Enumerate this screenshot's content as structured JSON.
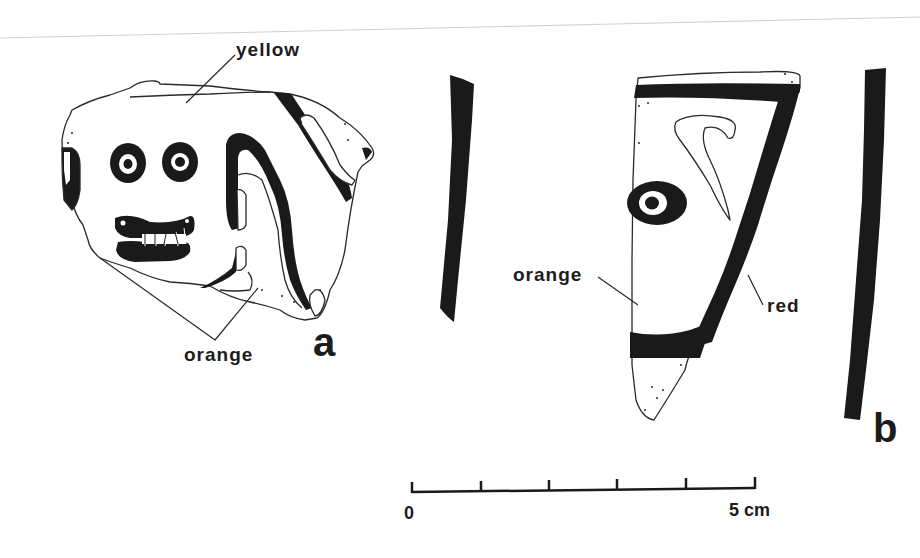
{
  "figure": {
    "sherd_a": {
      "letter": "a",
      "labels": {
        "top": "yellow",
        "bottom": "orange"
      }
    },
    "sherd_b": {
      "letter": "b",
      "labels": {
        "left": "orange",
        "right": "red"
      }
    },
    "scale_bar": {
      "start_label": "0",
      "end_label": "5 cm",
      "divisions": 5
    },
    "colors": {
      "ink": "#1a1a1a",
      "outline": "#2a2a2a",
      "background": "#ffffff",
      "border_line": "#c8c8c8"
    }
  }
}
